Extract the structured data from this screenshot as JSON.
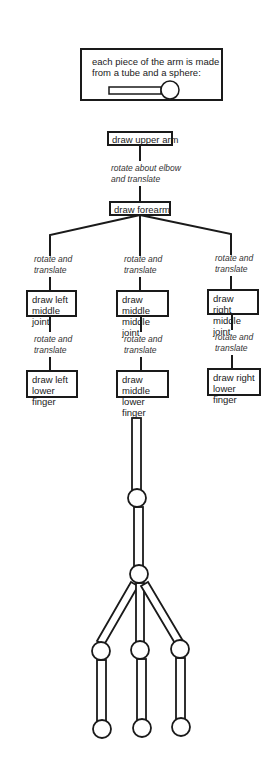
{
  "legend": {
    "text_line1": "each piece of the arm is made",
    "text_line2": "from a tube and a sphere:",
    "icon": "tube-and-sphere-icon"
  },
  "hierarchy": {
    "root": {
      "label": "draw upper arm"
    },
    "root_edge": {
      "line1": "rotate about elbow",
      "line2": "and translate"
    },
    "forearm": {
      "label": "draw forearm"
    },
    "branches": [
      {
        "side": "left",
        "edge1": {
          "line1": "rotate and",
          "line2": "translate"
        },
        "joint": {
          "line1": "draw left",
          "line2": "middle joint"
        },
        "edge2": {
          "line1": "rotate and",
          "line2": "translate"
        },
        "finger": {
          "line1": "draw left",
          "line2": "lower finger"
        }
      },
      {
        "side": "middle",
        "edge1": {
          "line1": "rotate and",
          "line2": "translate"
        },
        "joint": {
          "line1": "draw middle",
          "line2": "middle joint"
        },
        "edge2": {
          "line1": "rotate and",
          "line2": "translate"
        },
        "finger": {
          "line1": "draw middle",
          "line2": "lower finger"
        }
      },
      {
        "side": "right",
        "edge1": {
          "line1": "rotate and",
          "line2": "translate"
        },
        "joint": {
          "line1": "draw right",
          "line2": "middle joint"
        },
        "edge2": {
          "line1": "rotate and",
          "line2": "translate"
        },
        "finger": {
          "line1": "draw right",
          "line2": "lower finger"
        }
      }
    ]
  },
  "arm_illustration": {
    "parts": [
      "upper-arm",
      "elbow-sphere",
      "forearm",
      "wrist-sphere",
      "left-middle-joint",
      "middle-middle-joint",
      "right-middle-joint",
      "left-lower-finger",
      "middle-lower-finger",
      "right-lower-finger"
    ]
  },
  "colors": {
    "stroke": "#1a1a1a",
    "background": "#ffffff"
  }
}
